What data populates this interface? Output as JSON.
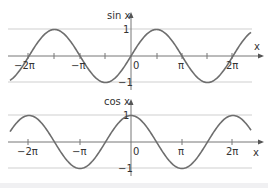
{
  "chart_data": [
    {
      "type": "line",
      "title": "sin x",
      "ylabel": "sin x",
      "xlabel": "x",
      "function": "sin",
      "x_range_pi": [
        -2.4,
        2.4
      ],
      "xlim": [
        -7.4,
        7.4
      ],
      "ylim": [
        -1.2,
        1.4
      ],
      "x_ticks": [
        "-2π",
        "-π",
        "0",
        "π",
        "2π"
      ],
      "x_tick_values": [
        -6.283,
        -3.142,
        0,
        3.142,
        6.283
      ],
      "y_ticks": [
        "1",
        "-1"
      ],
      "y_tick_values": [
        1,
        -1
      ],
      "gridlines_y": [
        1,
        -1
      ],
      "grid": true
    },
    {
      "type": "line",
      "title": "cos x",
      "ylabel": "cos x",
      "xlabel": "x",
      "function": "cos",
      "x_range_pi": [
        -2.4,
        2.4
      ],
      "xlim": [
        -7.4,
        7.4
      ],
      "ylim": [
        -1.2,
        1.4
      ],
      "x_ticks": [
        "-2π",
        "-π",
        "0",
        "π",
        "2π"
      ],
      "x_tick_values": [
        -6.283,
        -3.142,
        0,
        3.142,
        6.283
      ],
      "y_ticks": [
        "1",
        "-1"
      ],
      "y_tick_values": [
        1,
        -1
      ],
      "gridlines_y": [
        1,
        -1
      ],
      "grid": true
    }
  ],
  "labels": {
    "sin_title": "sin x",
    "cos_title": "cos x",
    "x_axis": "x",
    "one": "1",
    "neg_one": "−1",
    "zero": "0",
    "pi": "π",
    "neg_pi": "−π",
    "two_pi": "2π",
    "neg_two_pi": "−2π"
  },
  "colors": {
    "curve": "#6e6e6e",
    "axis": "#666666",
    "grid": "#c8c8c8"
  }
}
